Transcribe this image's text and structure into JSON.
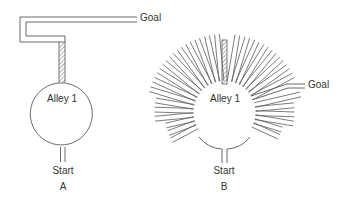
{
  "figure": {
    "panels": [
      {
        "id": "A",
        "caption": "A",
        "type": "single-alley maze",
        "chamber_label": "Alley 1",
        "start_label": "Start",
        "goal_label": "Goal",
        "hatched_alley": "top"
      },
      {
        "id": "B",
        "caption": "B",
        "type": "sunburst radial maze",
        "chamber_label": "Alley 1",
        "start_label": "Start",
        "goal_label": "Goal",
        "hatched_alley": "top",
        "radial_alley_count": 33
      }
    ]
  },
  "colors": {
    "line": "#5a5a5a",
    "text": "#333333",
    "background": "#ffffff"
  }
}
